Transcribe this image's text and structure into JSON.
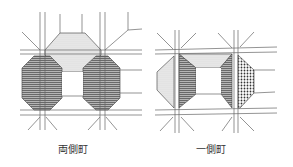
{
  "figure": {
    "panels": [
      {
        "id": "both-sides",
        "caption": "両側町"
      },
      {
        "id": "one-side",
        "caption": "一側町"
      }
    ]
  },
  "colors": {
    "line": "#555555",
    "hatch_fill": "#9a9a9a",
    "dot_fill": "#d8d8d8",
    "dense_dot": "#333333"
  }
}
